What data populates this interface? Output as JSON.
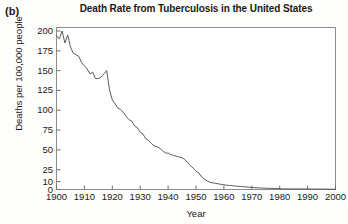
{
  "figure": {
    "panel_label": "(b)",
    "title": "Death Rate from Tuberculosis in the United States",
    "xlabel": "Year",
    "ylabel": "Deaths per 100,000 people"
  },
  "chart_data": {
    "type": "line",
    "title": "Death Rate from Tuberculosis in the United States",
    "xlabel": "Year",
    "ylabel": "Deaths per 100,000 people",
    "xlim": [
      1900,
      2000
    ],
    "ylim": [
      0,
      200
    ],
    "xticks": [
      1900,
      1910,
      1920,
      1930,
      1940,
      1950,
      1960,
      1970,
      1980,
      1990,
      2000
    ],
    "yticks": [
      0,
      10,
      25,
      50,
      75,
      100,
      125,
      150,
      175,
      200
    ],
    "grid": false,
    "legend": false,
    "line_color": "#4a4a4a",
    "series": [
      {
        "name": "TB death rate",
        "x": [
          1900,
          1901,
          1902,
          1903,
          1904,
          1905,
          1906,
          1907,
          1908,
          1909,
          1910,
          1911,
          1912,
          1913,
          1914,
          1915,
          1916,
          1917,
          1918,
          1919,
          1920,
          1921,
          1922,
          1923,
          1924,
          1925,
          1926,
          1927,
          1928,
          1929,
          1930,
          1931,
          1932,
          1933,
          1934,
          1935,
          1936,
          1937,
          1938,
          1939,
          1940,
          1941,
          1942,
          1943,
          1944,
          1945,
          1946,
          1947,
          1948,
          1949,
          1950,
          1951,
          1952,
          1953,
          1954,
          1955,
          1956,
          1957,
          1958,
          1959,
          1960,
          1961,
          1962,
          1963,
          1964,
          1965,
          1966,
          1967,
          1968,
          1969,
          1970,
          1971,
          1972,
          1973,
          1974,
          1975,
          1976,
          1977,
          1978,
          1979,
          1980,
          1981,
          1982,
          1983,
          1984,
          1985,
          1986,
          1987,
          1988,
          1989,
          1990,
          1991,
          1992,
          1993,
          1994,
          1995,
          1996,
          1997,
          1998,
          1999,
          2000
        ],
        "values": [
          194,
          190,
          200,
          185,
          195,
          180,
          172,
          170,
          168,
          160,
          156,
          152,
          146,
          148,
          140,
          140,
          142,
          146,
          150,
          126,
          113,
          108,
          103,
          101,
          97,
          92,
          88,
          86,
          80,
          78,
          72,
          70,
          64,
          62,
          58,
          55,
          54,
          52,
          49,
          46,
          46,
          44,
          43,
          42,
          41,
          40,
          38,
          34,
          30,
          27,
          23,
          21,
          16,
          13,
          11,
          9.1,
          8.4,
          7.8,
          7.1,
          6.5,
          6.0,
          5.4,
          5.1,
          4.9,
          4.3,
          4.1,
          3.9,
          3.5,
          3.3,
          2.9,
          2.6,
          2.3,
          2.2,
          1.9,
          1.8,
          1.6,
          1.5,
          1.4,
          1.3,
          1.2,
          0.9,
          0.8,
          0.8,
          0.7,
          0.7,
          0.7,
          0.7,
          0.7,
          0.7,
          0.7,
          0.7,
          0.6,
          0.6,
          0.6,
          0.5,
          0.5,
          0.5,
          0.4,
          0.4,
          0.4,
          0.3
        ]
      }
    ]
  },
  "axes": {
    "ytick_labels": [
      "200",
      "175",
      "150",
      "125",
      "100",
      "75",
      "50",
      "25",
      "10",
      "0"
    ],
    "xtick_labels": [
      "1900",
      "1910",
      "1920",
      "1930",
      "1940",
      "1950",
      "1960",
      "1970",
      "1980",
      "1990",
      "2000"
    ]
  }
}
